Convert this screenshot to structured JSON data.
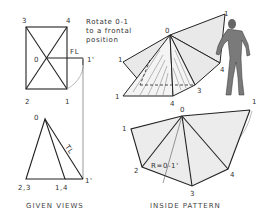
{
  "diagram": {
    "top_view": {
      "labels": [
        "3",
        "4",
        "2",
        "1",
        "0",
        "FL",
        "1'"
      ]
    },
    "front_view": {
      "labels": [
        "0",
        "TL",
        "2,3",
        "1,4",
        "1'"
      ]
    },
    "note": {
      "line1": "Rotate 0-1",
      "line2": "to a frontal",
      "line3": "position"
    },
    "pictorial": {
      "labels": [
        "0",
        "1",
        "1",
        "1",
        "4",
        "3",
        "4",
        "2"
      ]
    },
    "pattern": {
      "labels": [
        "0",
        "1",
        "1",
        "2",
        "3",
        "4",
        "4"
      ],
      "radius_label": "R=0-1'"
    },
    "captions": {
      "given_views": "GIVEN VIEWS",
      "inside_pattern": "INSIDE PATTERN"
    }
  }
}
